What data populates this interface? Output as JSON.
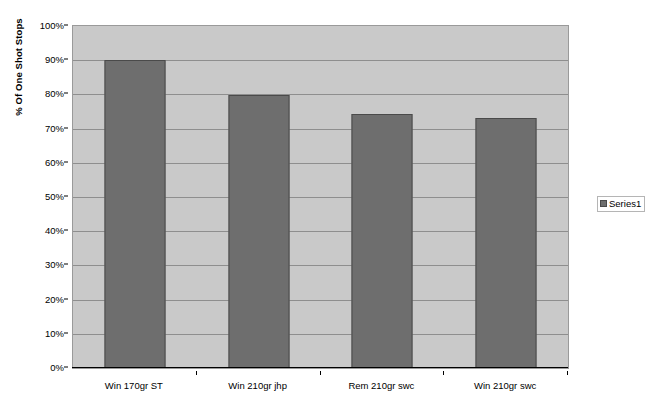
{
  "chart_data": {
    "type": "bar",
    "title": "",
    "xlabel": "",
    "ylabel": "% Of One Shot Stops",
    "categories": [
      "Win 170gr ST",
      "Win 210gr jhp",
      "Rem 210gr swc",
      "Win 210gr swc"
    ],
    "values": [
      90,
      79.8,
      74.4,
      73.1
    ],
    "series": [
      {
        "name": "Series1",
        "values": [
          90,
          79.8,
          74.4,
          73.1
        ]
      }
    ],
    "ylim": [
      0,
      100
    ],
    "ytick_labels": [
      "100%",
      "90%",
      "80%",
      "70%",
      "60%",
      "50%",
      "40%",
      "30%",
      "20%",
      "10%",
      "0%"
    ],
    "ytick_values": [
      100,
      90,
      80,
      70,
      60,
      50,
      40,
      30,
      20,
      10,
      0
    ],
    "grid": true,
    "legend_position": "right",
    "colors": {
      "bar_fill": "#6e6e6e",
      "bar_border": "#4a4a4a",
      "plot_background": "#c9c9c9",
      "gridline": "#8e8e8e",
      "axis": "#000000",
      "page_background": "#ffffff"
    }
  },
  "legend": {
    "entries": [
      {
        "label": "Series1"
      }
    ]
  }
}
